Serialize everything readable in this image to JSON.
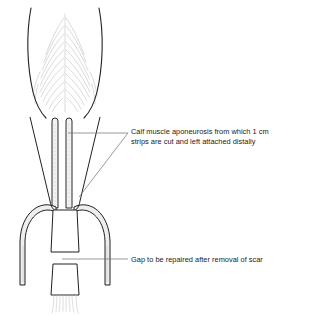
{
  "figure": {
    "background_color": "#ffffff",
    "ink_color": "#231f20",
    "fill_color": "#ffffff",
    "band_fill_color": "#f0f0f0",
    "hatch_color": "#b9b9bd",
    "leader_color": "#6f6f74"
  },
  "annotations": [
    {
      "id": "aponeurosis-label",
      "line1": "Calf muscle aponeurosis from which 1 cm",
      "line2": "strips are cut and left attached distally",
      "text_x": 131,
      "line1_y": 131,
      "line2_y": 141,
      "leaders": [
        {
          "name": "aponeurosis-leader-strip",
          "points": "128,133 103,133 68,133"
        },
        {
          "name": "aponeurosis-leader-arch",
          "points": "128,133 104,180 79,197"
        }
      ]
    },
    {
      "id": "gap-label",
      "line1": "Gap to be repaired after removal of scar",
      "text_x": 131,
      "line1_y": 262,
      "leaders": [
        {
          "name": "gap-leader",
          "points": "128,259 62,259"
        }
      ]
    }
  ],
  "anatomy": {
    "muscle_belly": {
      "name": "calf-muscle-belly",
      "left_outline": "M31,8 C26,34 27,66 33,92 C37,108 42,114 46,118",
      "right_outline": "M99,8 C104,34 103,66 97,92 C93,108 88,114 84,118"
    },
    "aponeurosis_edges": {
      "left": "M30,117 L50,200",
      "right": "M100,117 L80,200"
    },
    "strips": [
      {
        "name": "aponeurosis-strip-left",
        "x": 52,
        "y": 118,
        "width": 6,
        "height": 88
      },
      {
        "name": "aponeurosis-strip-right",
        "x": 66,
        "y": 118,
        "width": 6,
        "height": 88
      }
    ],
    "arches": [
      {
        "name": "strip-arch-left",
        "path": "M53,206 C38,200 20,214 19,240 L19,284"
      },
      {
        "name": "strip-arch-right",
        "path": "M77,206 C92,200 110,214 111,240 L111,284"
      }
    ],
    "tendon_proximal": {
      "name": "tendon-stump-proximal",
      "path": "M52,206 L50,252 L78,252 L76,206 Z"
    },
    "tendon_distal": {
      "name": "tendon-stump-distal",
      "path": "M52,264 L50,296 L78,296 L76,264 Z"
    },
    "gap": {
      "name": "tendon-gap",
      "top_y": 252,
      "bottom_y": 264
    }
  }
}
